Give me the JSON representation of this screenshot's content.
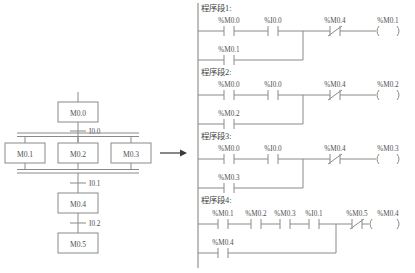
{
  "diagram": {
    "title_visible": false,
    "colors": {
      "background": "#ffffff",
      "line": "#8a8a8a",
      "text": "#4f4f4f",
      "arrow": "#3a3a3a"
    },
    "transition_arrow": {
      "name": "conversion-arrow",
      "glyph": "→"
    }
  },
  "sfc": {
    "steps": [
      {
        "id": "step-m00",
        "label": "M0.0"
      },
      {
        "id": "step-m01",
        "label": "M0.1"
      },
      {
        "id": "step-m02",
        "label": "M0.2"
      },
      {
        "id": "step-m03",
        "label": "M0.3"
      },
      {
        "id": "step-m04",
        "label": "M0.4"
      },
      {
        "id": "step-m05",
        "label": "M0.5"
      }
    ],
    "transitions": [
      {
        "id": "transition-i00",
        "label": "I0.0"
      },
      {
        "id": "transition-i01",
        "label": "I0.1"
      },
      {
        "id": "transition-i02",
        "label": "I0.2"
      }
    ],
    "branch_type": "simultaneous-parallel-double-line"
  },
  "ladder": {
    "networks": [
      {
        "title": "程序段1:",
        "rung_main": [
          {
            "type": "contact-no",
            "label": "%M0.0"
          },
          {
            "type": "contact-no",
            "label": "%I0.0"
          },
          {
            "type": "contact-nc",
            "label": "%M0.4"
          }
        ],
        "coil": {
          "type": "coil",
          "label": "%M0.1"
        },
        "branch": [
          {
            "type": "contact-no",
            "label": "%M0.1"
          }
        ]
      },
      {
        "title": "程序段2:",
        "rung_main": [
          {
            "type": "contact-no",
            "label": "%M0.0"
          },
          {
            "type": "contact-no",
            "label": "%I0.0"
          },
          {
            "type": "contact-nc",
            "label": "%M0.4"
          }
        ],
        "coil": {
          "type": "coil",
          "label": "%M0.2"
        },
        "branch": [
          {
            "type": "contact-no",
            "label": "%M0.2"
          }
        ]
      },
      {
        "title": "程序段3:",
        "rung_main": [
          {
            "type": "contact-no",
            "label": "%M0.0"
          },
          {
            "type": "contact-no",
            "label": "%I0.0"
          },
          {
            "type": "contact-nc",
            "label": "%M0.4"
          }
        ],
        "coil": {
          "type": "coil",
          "label": "%M0.3"
        },
        "branch": [
          {
            "type": "contact-no",
            "label": "%M0.3"
          }
        ]
      },
      {
        "title": "程序段4:",
        "rung_main": [
          {
            "type": "contact-no",
            "label": "%M0.1"
          },
          {
            "type": "contact-no",
            "label": "%M0.2"
          },
          {
            "type": "contact-no",
            "label": "%M0.3"
          },
          {
            "type": "contact-no",
            "label": "%I0.1"
          },
          {
            "type": "contact-nc",
            "label": "%M0.5"
          }
        ],
        "coil": {
          "type": "coil",
          "label": "%M0.4"
        },
        "branch": [
          {
            "type": "contact-no",
            "label": "%M0.4"
          }
        ]
      }
    ]
  }
}
